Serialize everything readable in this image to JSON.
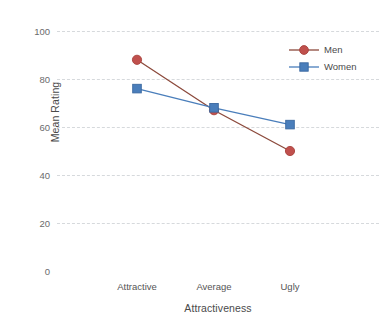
{
  "chart_data": {
    "type": "line",
    "title": "",
    "xlabel": "Attractiveness",
    "ylabel": "Mean Rating",
    "categories": [
      "Attractive",
      "Average",
      "Ugly"
    ],
    "series": [
      {
        "name": "Men",
        "values": [
          88,
          67,
          50
        ],
        "color": "#C0504D",
        "marker": "circle"
      },
      {
        "name": "Women",
        "values": [
          76,
          68,
          61
        ],
        "color": "#4A7EBB",
        "marker": "square"
      }
    ],
    "ylim": [
      0,
      100
    ],
    "yticks": [
      0,
      20,
      40,
      60,
      80,
      100
    ],
    "ytick_labels": [
      "0",
      "20",
      "40",
      "60",
      "80",
      "100"
    ],
    "gridlines": {
      "y": [
        20,
        40,
        60,
        80,
        100
      ],
      "color": "#d6d9dc",
      "style": "dashed"
    },
    "legend": {
      "position": "top-right-inside",
      "entries": [
        "Men",
        "Women"
      ]
    },
    "background": "#FFFFFF"
  },
  "axes": {
    "y_title": "Mean Rating",
    "x_title": "Attractiveness"
  },
  "legend": {
    "men_label": "Men",
    "women_label": "Women"
  }
}
